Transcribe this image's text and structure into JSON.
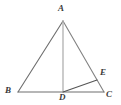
{
  "figure": {
    "type": "geometry-diagram",
    "background_color": "#ffffff",
    "canvas": {
      "width": 121,
      "height": 105
    },
    "labels": {
      "A": "A",
      "B": "B",
      "C": "C",
      "D": "D",
      "E": "E"
    },
    "points": {
      "A": {
        "x": 63,
        "y": 21
      },
      "B": {
        "x": 18,
        "y": 92
      },
      "C": {
        "x": 104,
        "y": 92
      },
      "D": {
        "x": 63,
        "y": 92
      },
      "E": {
        "x": 97,
        "y": 80
      }
    },
    "segments": [
      {
        "name": "AB",
        "from": "A",
        "to": "B",
        "color": "#6e6e6e",
        "width": 1.1
      },
      {
        "name": "AC",
        "from": "A",
        "to": "C",
        "color": "#828282",
        "width": 1.1
      },
      {
        "name": "BC",
        "from": "B",
        "to": "C",
        "color": "#6e6e6e",
        "width": 1.1
      },
      {
        "name": "AD",
        "from": "A",
        "to": "D",
        "color": "#b0b0b0",
        "width": 1.3
      },
      {
        "name": "DE",
        "from": "D",
        "to": "E",
        "color": "#555555",
        "width": 1.1
      }
    ],
    "colors": {
      "stroke_dark": "#6e6e6e",
      "stroke_light": "#b0b0b0",
      "stroke_accent": "#555555",
      "label": "#3a3a3a"
    }
  }
}
